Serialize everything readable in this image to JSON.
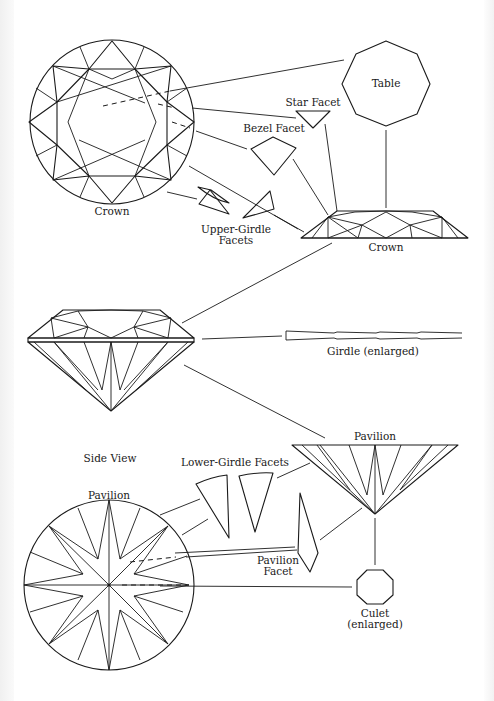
{
  "diagram": {
    "labels": {
      "crown_top": "Crown",
      "table": "Table",
      "star_facet": "Star Facet",
      "bezel_facet": "Bezel Facet",
      "upper_girdle_1": "Upper-Girdle",
      "upper_girdle_2": "Facets",
      "crown_side": "Crown",
      "girdle": "Girdle (enlarged)",
      "side_view": "Side View",
      "pavilion_side": "Pavilion",
      "lower_girdle": "Lower-Girdle Facets",
      "pavilion_bottom": "Pavilion",
      "pavilion_facet_1": "Pavilion",
      "pavilion_facet_2": "Facet",
      "culet_1": "Culet",
      "culet_2": "(enlarged)"
    },
    "colors": {
      "line": "#1a1a1a",
      "background": "#ffffff"
    }
  }
}
